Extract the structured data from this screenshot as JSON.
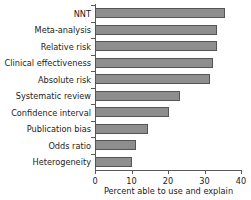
{
  "chart_data": {
    "type": "bar",
    "orientation": "horizontal",
    "title": "",
    "xlabel": "Percent able to use and explain",
    "ylabel": "",
    "categories": [
      "NNT",
      "Meta-analysis",
      "Relative risk",
      "Clinical effectiveness",
      "Absolute risk",
      "Systematic review",
      "Confidence interval",
      "Publication bias",
      "Odds ratio",
      "Heterogeneity"
    ],
    "values": [
      35.6,
      33.5,
      33.5,
      32.3,
      31.5,
      23.3,
      20.3,
      14.5,
      11.3,
      10.0
    ],
    "xlim": [
      0,
      40
    ],
    "xticks": [
      0,
      10,
      20,
      30,
      40
    ],
    "xtick_labels": [
      "0",
      "10",
      "20",
      "30",
      "40"
    ],
    "grid": false,
    "legend": null,
    "colors": {
      "bar_fill": "#8e8e8e",
      "bar_border": "#555555",
      "axis": "#5a5a5a",
      "text": "#1c1c1c",
      "background": "#ffffff"
    }
  }
}
